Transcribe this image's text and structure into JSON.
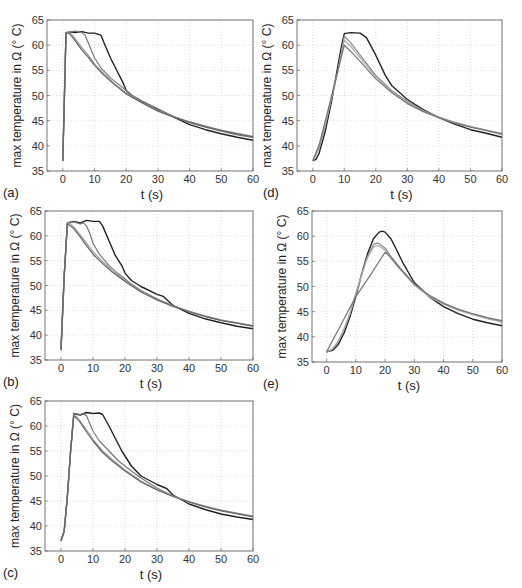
{
  "figure": {
    "panels": [
      "a",
      "d",
      "b",
      "e",
      "c"
    ]
  },
  "chart_data": [
    {
      "id": "a",
      "label": "(a)",
      "type": "line",
      "xlabel": "t (s)",
      "ylabel": "max temperature in Ω (° C)",
      "xlim": [
        -5,
        60
      ],
      "ylim": [
        35,
        65
      ],
      "xticks": [
        0,
        10,
        20,
        30,
        40,
        50,
        60
      ],
      "yticks": [
        35,
        40,
        45,
        50,
        55,
        60,
        65
      ],
      "grid": true,
      "series": [
        {
          "name": "curve 1 (black)",
          "color": "#222222",
          "x": [
            0,
            1,
            2,
            4,
            6,
            8,
            10,
            12,
            13,
            15,
            17,
            19,
            20,
            22,
            25,
            30,
            35,
            40,
            45,
            50,
            55,
            60
          ],
          "y": [
            37,
            62.5,
            62.6,
            62.5,
            62.7,
            62.4,
            62.4,
            62.0,
            60.5,
            57.5,
            55.0,
            52.5,
            51.0,
            49.8,
            48.8,
            47.3,
            45.7,
            44.2,
            43.2,
            42.4,
            41.7,
            41.1
          ]
        },
        {
          "name": "curve 2 (gray)",
          "color": "#777777",
          "x": [
            0,
            1,
            2,
            4,
            6,
            7,
            8,
            10,
            12,
            15,
            18,
            20,
            22,
            25,
            30,
            35,
            40,
            45,
            50,
            55,
            60
          ],
          "y": [
            37,
            62.5,
            62.6,
            62.8,
            62.5,
            62.0,
            60.5,
            57.5,
            55.5,
            53.5,
            52.0,
            51.0,
            50.0,
            48.9,
            47.2,
            45.8,
            44.6,
            43.7,
            42.9,
            42.2,
            41.7
          ]
        },
        {
          "name": "curve 3 (light gray)",
          "color": "#999999",
          "x": [
            0,
            1,
            2,
            3,
            4,
            6,
            8,
            10,
            13,
            16,
            20,
            25,
            30,
            35,
            40,
            45,
            50,
            55,
            60
          ],
          "y": [
            37,
            62.5,
            62.5,
            62.0,
            61.2,
            59.5,
            58.0,
            56.3,
            54.3,
            52.5,
            50.5,
            48.6,
            47.0,
            45.8,
            44.8,
            43.9,
            43.1,
            42.5,
            41.9
          ]
        },
        {
          "name": "curve 4 (gray)",
          "color": "#666666",
          "x": [
            0,
            1,
            2,
            3,
            4,
            6,
            8,
            10,
            13,
            16,
            20,
            25,
            30,
            35,
            40,
            45,
            50,
            55,
            60
          ],
          "y": [
            37,
            62.5,
            62.3,
            61.6,
            60.8,
            59.0,
            57.6,
            56.0,
            54.0,
            52.3,
            50.3,
            48.5,
            46.9,
            45.7,
            44.7,
            43.8,
            43.0,
            42.4,
            41.8
          ]
        }
      ]
    },
    {
      "id": "d",
      "label": "(d)",
      "type": "line",
      "xlabel": "t (s)",
      "ylabel": "max temperature in Ω (° C)",
      "xlim": [
        -5,
        60
      ],
      "ylim": [
        35,
        65
      ],
      "xticks": [
        0,
        10,
        20,
        30,
        40,
        50,
        60
      ],
      "yticks": [
        35,
        40,
        45,
        50,
        55,
        60,
        65
      ],
      "grid": true,
      "series": [
        {
          "name": "curve 1 (black)",
          "color": "#222222",
          "x": [
            0,
            1,
            2,
            4,
            6,
            8,
            9,
            10,
            12,
            15,
            17,
            20,
            23,
            25,
            30,
            35,
            40,
            45,
            50,
            55,
            60
          ],
          "y": [
            37,
            37.3,
            38.5,
            43,
            49,
            56,
            59.5,
            62.3,
            62.5,
            62.4,
            61.5,
            58.0,
            54.0,
            52.0,
            49.2,
            47.2,
            45.6,
            44.3,
            43.2,
            42.5,
            41.7
          ]
        },
        {
          "name": "curve 2 (gray)",
          "color": "#888888",
          "x": [
            0,
            2,
            4,
            6,
            8,
            10,
            12,
            15,
            20,
            25,
            30,
            35,
            40,
            45,
            50,
            55,
            60
          ],
          "y": [
            37,
            39.5,
            44,
            49.5,
            55,
            61.8,
            60.5,
            58.0,
            54.0,
            51.0,
            48.8,
            47.0,
            45.7,
            44.7,
            43.8,
            43.1,
            42.5
          ]
        },
        {
          "name": "curve 3 (light gray)",
          "color": "#aaaaaa",
          "x": [
            0,
            2,
            4,
            6,
            8,
            10,
            12,
            15,
            20,
            25,
            30,
            35,
            40,
            45,
            50,
            55,
            60
          ],
          "y": [
            37,
            39.8,
            44.5,
            49.8,
            55,
            61.0,
            59.8,
            57.5,
            53.7,
            50.8,
            48.6,
            46.9,
            45.6,
            44.6,
            43.8,
            43.1,
            42.4
          ]
        },
        {
          "name": "curve 4 (gray)",
          "color": "#777777",
          "x": [
            0,
            2,
            4,
            6,
            8,
            10,
            12,
            15,
            20,
            25,
            30,
            35,
            40,
            45,
            50,
            55,
            60
          ],
          "y": [
            37,
            40.2,
            45,
            50,
            55,
            60.0,
            58.8,
            56.8,
            53.3,
            50.6,
            48.4,
            46.8,
            45.6,
            44.5,
            43.7,
            43.0,
            42.3
          ]
        }
      ]
    },
    {
      "id": "b",
      "label": "(b)",
      "type": "line",
      "xlabel": "t (s)",
      "ylabel": "max temperature in Ω (° C)",
      "xlim": [
        -5,
        60
      ],
      "ylim": [
        35,
        65
      ],
      "xticks": [
        0,
        10,
        20,
        30,
        40,
        50,
        60
      ],
      "yticks": [
        35,
        40,
        45,
        50,
        55,
        60,
        65
      ],
      "grid": true,
      "series": [
        {
          "name": "curve 1 (black)",
          "color": "#222222",
          "x": [
            0,
            1,
            2,
            4,
            6,
            8,
            10,
            12,
            13,
            15,
            17,
            19,
            20,
            22,
            25,
            30,
            32,
            35,
            40,
            45,
            50,
            55,
            60
          ],
          "y": [
            37,
            52,
            62.6,
            62.9,
            62.6,
            63.1,
            62.9,
            62.9,
            62.0,
            59.0,
            56.0,
            54.0,
            52.5,
            51.0,
            49.8,
            48.2,
            47.8,
            46.0,
            44.4,
            43.3,
            42.5,
            41.8,
            41.3
          ]
        },
        {
          "name": "curve 2 (gray)",
          "color": "#777777",
          "x": [
            0,
            1,
            2,
            4,
            6,
            7,
            8,
            9,
            10,
            12,
            15,
            18,
            20,
            22,
            25,
            30,
            35,
            40,
            45,
            50,
            55,
            60
          ],
          "y": [
            37,
            52,
            62.6,
            62.8,
            62.4,
            62.6,
            62.0,
            60.5,
            58.5,
            56.3,
            54.0,
            52.3,
            51.3,
            50.3,
            49.0,
            47.3,
            45.9,
            44.8,
            43.8,
            43.0,
            42.4,
            41.8
          ]
        },
        {
          "name": "curve 3 (light gray)",
          "color": "#999999",
          "x": [
            0,
            1,
            2,
            3,
            4,
            6,
            8,
            10,
            13,
            16,
            20,
            25,
            30,
            35,
            40,
            45,
            50,
            55,
            60
          ],
          "y": [
            37,
            52,
            62.6,
            62.4,
            61.8,
            60.2,
            58.5,
            56.8,
            54.8,
            53.0,
            51.0,
            48.9,
            47.2,
            45.9,
            44.8,
            43.9,
            43.1,
            42.5,
            41.9
          ]
        },
        {
          "name": "curve 4 (gray)",
          "color": "#666666",
          "x": [
            0,
            1,
            2,
            3,
            4,
            6,
            8,
            10,
            13,
            16,
            20,
            25,
            30,
            35,
            40,
            45,
            50,
            55,
            60
          ],
          "y": [
            37,
            52,
            62.4,
            62.0,
            61.4,
            59.8,
            58.0,
            56.3,
            54.4,
            52.7,
            50.8,
            48.7,
            47.1,
            45.8,
            44.7,
            43.8,
            43.0,
            42.4,
            41.8
          ]
        }
      ]
    },
    {
      "id": "e",
      "label": "(e)",
      "type": "line",
      "xlabel": "t (s)",
      "ylabel": "max temperature in Ω (° C)",
      "xlim": [
        -5,
        60
      ],
      "ylim": [
        35,
        65
      ],
      "xticks": [
        0,
        10,
        20,
        30,
        40,
        50,
        60
      ],
      "yticks": [
        35,
        40,
        45,
        50,
        55,
        60,
        65
      ],
      "grid": true,
      "series": [
        {
          "name": "curve 1 (black)",
          "color": "#222222",
          "x": [
            0,
            2,
            4,
            6,
            8,
            10,
            12,
            14,
            16,
            18,
            19,
            20,
            22,
            24,
            26,
            30,
            35,
            40,
            45,
            50,
            55,
            60
          ],
          "y": [
            37,
            37.3,
            38.5,
            40.8,
            44,
            48,
            52.5,
            56.5,
            59.5,
            60.8,
            61.0,
            60.8,
            59.5,
            57.2,
            54.8,
            50.8,
            48.0,
            46.0,
            44.6,
            43.5,
            42.8,
            42.2
          ]
        },
        {
          "name": "curve 2 (gray)",
          "color": "#888888",
          "x": [
            0,
            2,
            4,
            6,
            8,
            10,
            12,
            14,
            16,
            17,
            18,
            20,
            22,
            25,
            30,
            35,
            40,
            45,
            50,
            55,
            60
          ],
          "y": [
            37,
            37.5,
            39,
            41.5,
            44.5,
            48.5,
            52.5,
            56,
            58.3,
            58.6,
            58.5,
            57.6,
            56.0,
            53.8,
            50.5,
            48.2,
            46.6,
            45.4,
            44.5,
            43.7,
            43.0
          ]
        },
        {
          "name": "curve 3 (light gray)",
          "color": "#aaaaaa",
          "x": [
            0,
            2,
            4,
            6,
            8,
            10,
            12,
            14,
            16,
            17,
            18,
            20,
            22,
            25,
            30,
            35,
            40,
            45,
            50,
            55,
            60
          ],
          "y": [
            37,
            37.6,
            39.2,
            41.7,
            44.7,
            48.6,
            52.3,
            55.7,
            57.8,
            58.1,
            58.0,
            57.2,
            55.6,
            53.5,
            50.3,
            48.0,
            46.5,
            45.3,
            44.4,
            43.6,
            42.9
          ]
        },
        {
          "name": "curve 4 (gray)",
          "color": "#777777",
          "x": [
            0,
            5,
            10,
            15,
            20,
            22,
            25,
            30,
            35,
            40,
            45,
            50,
            55,
            60
          ],
          "y": [
            37,
            42.5,
            48,
            52.3,
            56.8,
            55.8,
            53.6,
            50.5,
            48.3,
            46.7,
            45.5,
            44.6,
            43.8,
            43.2
          ]
        }
      ]
    },
    {
      "id": "c",
      "label": "(c)",
      "type": "line",
      "xlabel": "t (s)",
      "ylabel": "max temperature in Ω (° C)",
      "xlim": [
        -5,
        60
      ],
      "ylim": [
        35,
        65
      ],
      "xticks": [
        0,
        10,
        20,
        30,
        40,
        50,
        60
      ],
      "yticks": [
        35,
        40,
        45,
        50,
        55,
        60,
        65
      ],
      "grid": true,
      "series": [
        {
          "name": "curve 1 (black)",
          "color": "#222222",
          "x": [
            0,
            1,
            2,
            3,
            4,
            6,
            8,
            10,
            12,
            13,
            15,
            17,
            19,
            20,
            22,
            25,
            30,
            33,
            35,
            40,
            45,
            50,
            55,
            60
          ],
          "y": [
            37,
            39,
            46,
            55,
            62.5,
            62.2,
            62.7,
            62.5,
            62.6,
            62.3,
            60.0,
            57.5,
            55.0,
            54.0,
            52.0,
            50.0,
            48.3,
            47.5,
            46.2,
            44.4,
            43.3,
            42.4,
            41.8,
            41.3
          ]
        },
        {
          "name": "curve 2 (gray)",
          "color": "#777777",
          "x": [
            0,
            1,
            2,
            3,
            4,
            6,
            7,
            8,
            9,
            10,
            12,
            15,
            18,
            20,
            22,
            25,
            30,
            35,
            40,
            45,
            50,
            55,
            60
          ],
          "y": [
            37,
            39,
            46,
            55,
            62.5,
            62.3,
            62.5,
            62.0,
            60.5,
            59.0,
            57.0,
            55.0,
            53.0,
            52.0,
            51.0,
            49.6,
            47.6,
            46.0,
            44.8,
            43.8,
            43.0,
            42.4,
            41.8
          ]
        },
        {
          "name": "curve 3 (light gray)",
          "color": "#999999",
          "x": [
            0,
            1,
            2,
            3,
            4,
            5,
            6,
            8,
            10,
            13,
            16,
            20,
            25,
            30,
            35,
            40,
            45,
            50,
            55,
            60
          ],
          "y": [
            37,
            39,
            46,
            55,
            62.2,
            61.8,
            61.0,
            59.2,
            57.3,
            55.0,
            53.3,
            51.2,
            49.0,
            47.3,
            46.0,
            44.9,
            44.0,
            43.2,
            42.6,
            42.0
          ]
        },
        {
          "name": "curve 4 (gray)",
          "color": "#666666",
          "x": [
            0,
            1,
            2,
            3,
            4,
            5,
            6,
            8,
            10,
            13,
            16,
            20,
            25,
            30,
            35,
            40,
            45,
            50,
            55,
            60
          ],
          "y": [
            37,
            39,
            46,
            55,
            62.0,
            61.5,
            60.7,
            58.8,
            57.0,
            54.7,
            53.0,
            51.0,
            48.8,
            47.2,
            45.9,
            44.8,
            43.9,
            43.1,
            42.5,
            41.9
          ]
        }
      ]
    }
  ],
  "layout": {
    "a": {
      "left": 47,
      "top": 20,
      "right": 253,
      "bottom": 171
    },
    "d": {
      "left": 297,
      "top": 20,
      "right": 502,
      "bottom": 171
    },
    "b": {
      "left": 45,
      "top": 211,
      "right": 253,
      "bottom": 360
    },
    "e": {
      "left": 312,
      "top": 211,
      "right": 502,
      "bottom": 362
    },
    "c": {
      "left": 45,
      "top": 401,
      "right": 253,
      "bottom": 551
    }
  }
}
